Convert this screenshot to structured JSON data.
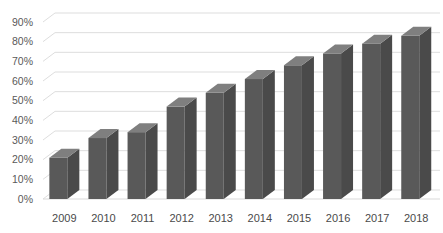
{
  "chart_data": {
    "type": "bar",
    "title": "",
    "subtitle": "",
    "xlabel": "",
    "ylabel": "",
    "categories": [
      "2009",
      "2010",
      "2011",
      "2012",
      "2013",
      "2014",
      "2015",
      "2016",
      "2017",
      "2018"
    ],
    "values": [
      21,
      31,
      34,
      47,
      54,
      61,
      68,
      74,
      79,
      83
    ],
    "value_suffix": "%",
    "ylim": [
      0,
      90
    ],
    "ytick_step": 10,
    "ytick_labels": [
      "0%",
      "10%",
      "20%",
      "30%",
      "40%",
      "50%",
      "60%",
      "70%",
      "80%",
      "90%"
    ],
    "grid": true,
    "grid_axis": "y",
    "legend": false,
    "legend_position": "none",
    "style": "3d-column",
    "series": [
      {
        "name": "Series 1",
        "values": [
          21,
          31,
          34,
          47,
          54,
          61,
          68,
          74,
          79,
          83
        ]
      }
    ],
    "colors": {
      "bar_front": "#595959",
      "bar_top": "#7f7f7f",
      "bar_side": "#4a4a4a",
      "gridline": "#d9d9d9",
      "floor": "#e8e8e8",
      "background": "#ffffff",
      "axis_text": "#595959"
    }
  }
}
